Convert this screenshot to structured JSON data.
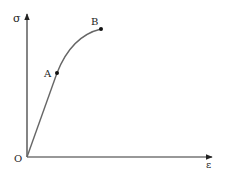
{
  "diagram": {
    "axes": {
      "y_label": "σ",
      "x_label": "ε",
      "origin_label": "O"
    },
    "points": [
      {
        "name": "O",
        "label": "O",
        "x": 27,
        "y": 157
      },
      {
        "name": "A",
        "label": "A",
        "x": 57,
        "y": 73
      },
      {
        "name": "B",
        "label": "B",
        "x": 101,
        "y": 29
      }
    ],
    "segments": [
      {
        "from": "O",
        "to": "A",
        "kind": "straight"
      },
      {
        "from": "A",
        "to": "B",
        "kind": "curve"
      }
    ],
    "colors": {
      "axis": "#333333",
      "curve": "#666666",
      "point": "#111111",
      "text": "#222222"
    }
  }
}
